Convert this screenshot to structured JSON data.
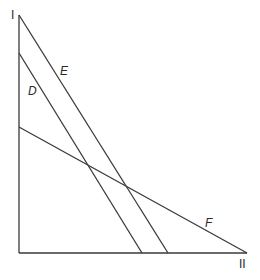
{
  "diagram": {
    "axes": {
      "vertical_label": "I",
      "horizontal_label": "II"
    },
    "lines": [
      {
        "label": "E",
        "from": [
          19,
          15
        ],
        "to": [
          168,
          253
        ]
      },
      {
        "label": "D",
        "from": [
          19,
          53
        ],
        "to": [
          142,
          253
        ]
      },
      {
        "label": "F",
        "from": [
          19,
          127
        ],
        "to": [
          247,
          253
        ]
      }
    ],
    "colors": {
      "line": "#3a3a3a",
      "background": "#ffffff"
    }
  }
}
